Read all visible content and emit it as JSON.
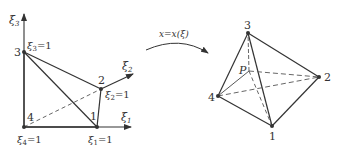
{
  "left_diagram": {
    "axes": {
      "xi3": "ξ",
      "xi3_sub": "3",
      "xi2": "ξ",
      "xi2_sub": "2",
      "xi1": "ξ",
      "xi1_sub": "1"
    },
    "nodes": {
      "n1": "1",
      "n2": "2",
      "n3": "3",
      "n4": "4"
    },
    "conditions": {
      "c3": "ξ",
      "c3_sub": "3",
      "c3_eq": "=1",
      "c2": "ξ",
      "c2_sub": "2",
      "c2_eq": "=1",
      "c1": "ξ",
      "c1_sub": "1",
      "c1_eq": "=1",
      "c4": "ξ",
      "c4_sub": "4",
      "c4_eq": "=1"
    }
  },
  "mapping": {
    "label": "x=x(ξ)"
  },
  "right_diagram": {
    "nodes": {
      "n1": "1",
      "n2": "2",
      "n3": "3",
      "n4": "4",
      "p": "P"
    }
  },
  "colors": {
    "line": "#333333",
    "dashed": "#555555"
  }
}
